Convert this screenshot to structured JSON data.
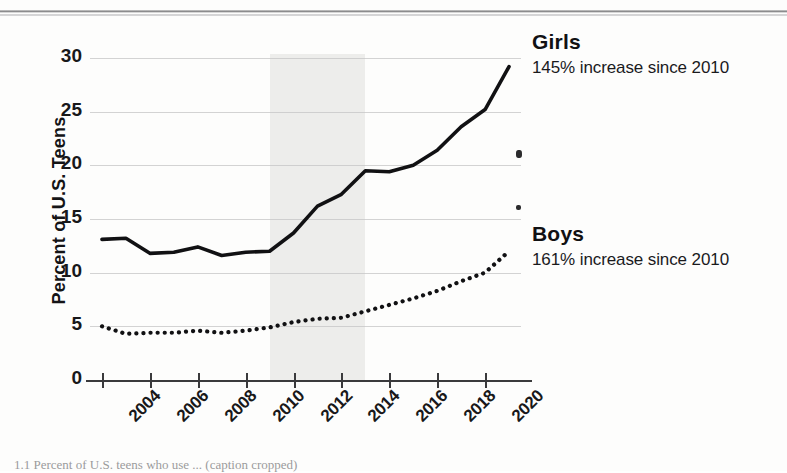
{
  "figure": {
    "caption": "1.1  Percent of U.S. teens who use ... (caption cropped)"
  },
  "chart_data": {
    "type": "line",
    "title": "",
    "xlabel": "",
    "ylabel": "Percent of U.S. Teens",
    "x": [
      2004,
      2005,
      2006,
      2007,
      2008,
      2009,
      2010,
      2011,
      2012,
      2013,
      2014,
      2015,
      2016,
      2017,
      2018,
      2019,
      2020,
      2021
    ],
    "xlim": [
      2003.5,
      2021.5
    ],
    "ylim": [
      0,
      30
    ],
    "x_ticks": [
      2004,
      2006,
      2008,
      2010,
      2012,
      2014,
      2016,
      2018,
      2020
    ],
    "x_tick_labels": [
      "2004",
      "2006",
      "2008",
      "2010",
      "2012",
      "2014",
      "2016",
      "2018",
      "2020"
    ],
    "y_ticks": [
      0,
      5,
      10,
      15,
      20,
      25,
      30
    ],
    "y_tick_labels": [
      "0",
      "5",
      "10",
      "15",
      "20",
      "25",
      "30"
    ],
    "grid": true,
    "legend_position": "right-inline-annotations",
    "shaded_region": {
      "label": "",
      "x_start": 2011,
      "x_end": 2015,
      "color": "#ececea"
    },
    "series": [
      {
        "name": "Girls",
        "style": "solid",
        "color": "#111113",
        "annotation": "145% increase since 2010",
        "values": [
          13.1,
          13.2,
          11.8,
          11.9,
          12.4,
          11.6,
          11.9,
          12.0,
          13.7,
          16.2,
          17.3,
          19.5,
          19.4,
          20.0,
          21.4,
          23.6,
          25.2,
          29.2
        ]
      },
      {
        "name": "Boys",
        "style": "dotted",
        "color": "#111113",
        "annotation": "161% increase since 2010",
        "values": [
          5.0,
          4.3,
          4.4,
          4.4,
          4.6,
          4.4,
          4.6,
          4.9,
          5.4,
          5.7,
          5.8,
          6.4,
          7.0,
          7.6,
          8.3,
          9.2,
          10.0,
          12.0
        ]
      }
    ]
  },
  "annotations": {
    "girls_name": "Girls",
    "girls_note": "145% increase since 2010",
    "boys_name": "Boys",
    "boys_note": "161% increase since 2010"
  }
}
